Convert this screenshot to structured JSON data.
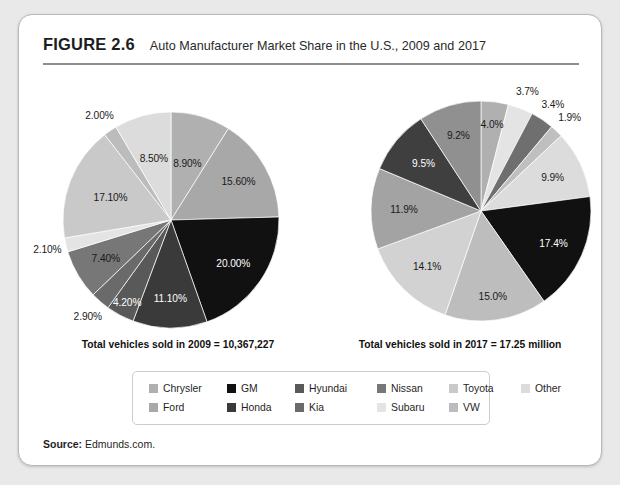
{
  "figure": {
    "number": "FIGURE 2.6",
    "title": "Auto Manufacturer Market Share in the U.S., 2009 and 2017"
  },
  "source": {
    "label": "Source:",
    "text": "Edmunds.com."
  },
  "legend": {
    "rows": [
      [
        {
          "label": "Chrysler",
          "color": "#b0b0b0"
        },
        {
          "label": "GM",
          "color": "#111111"
        },
        {
          "label": "Hyundai",
          "color": "#595959"
        },
        {
          "label": "Nissan",
          "color": "#777777"
        },
        {
          "label": "Toyota",
          "color": "#c9c9c9"
        },
        {
          "label": "Other",
          "color": "#dcdcdc"
        }
      ],
      [
        {
          "label": "Ford",
          "color": "#a8a8a8"
        },
        {
          "label": "Honda",
          "color": "#3a3a3a"
        },
        {
          "label": "Kia",
          "color": "#6a6a6a"
        },
        {
          "label": "Subaru",
          "color": "#e4e4e4"
        },
        {
          "label": "VW",
          "color": "#bcbcbc"
        }
      ]
    ]
  },
  "chart_data": [
    {
      "type": "pie",
      "title": "Auto Manufacturer Market Share in the U.S., 2009",
      "caption": "Total vehicles sold in 2009 = 10,367,227",
      "legend_position": "bottom",
      "labels": [
        "Chrysler",
        "GM",
        "Hyundai",
        "Nissan",
        "Toyota",
        "Other",
        "Ford",
        "Honda",
        "Kia",
        "Subaru",
        "VW"
      ],
      "slices": [
        {
          "name": "Chrysler",
          "value": 8.9,
          "display": "8.90%",
          "color": "#b0b0b0"
        },
        {
          "name": "Ford",
          "value": 15.6,
          "display": "15.60%",
          "color": "#a8a8a8"
        },
        {
          "name": "GM",
          "value": 20.0,
          "display": "20.00%",
          "color": "#111111"
        },
        {
          "name": "Honda",
          "value": 11.1,
          "display": "11.10%",
          "color": "#3a3a3a"
        },
        {
          "name": "Hyundai",
          "value": 4.2,
          "display": "4.20%",
          "color": "#595959"
        },
        {
          "name": "Kia",
          "value": 2.9,
          "display": "2.90%",
          "color": "#6a6a6a"
        },
        {
          "name": "Nissan",
          "value": 7.4,
          "display": "7.40%",
          "color": "#777777"
        },
        {
          "name": "Subaru",
          "value": 2.1,
          "display": "2.10%",
          "color": "#e4e4e4"
        },
        {
          "name": "Toyota",
          "value": 17.1,
          "display": "17.10%",
          "color": "#c9c9c9"
        },
        {
          "name": "VW",
          "value": 2.0,
          "display": "2.00%",
          "color": "#bcbcbc"
        },
        {
          "name": "Other",
          "value": 8.5,
          "display": "8.50%",
          "color": "#dcdcdc"
        }
      ]
    },
    {
      "type": "pie",
      "title": "Auto Manufacturer Market Share in the U.S., 2017",
      "caption": "Total vehicles sold in 2017 = 17.25 million",
      "legend_position": "bottom",
      "labels": [
        "Chrysler",
        "GM",
        "Hyundai",
        "Nissan",
        "Toyota",
        "Other",
        "Ford",
        "Honda",
        "Kia",
        "Subaru",
        "VW"
      ],
      "slices": [
        {
          "name": "Chrysler",
          "value": 4.0,
          "display": "4.0%",
          "color": "#b0b0b0"
        },
        {
          "name": "Subaru",
          "value": 3.7,
          "display": "3.7%",
          "color": "#e4e4e4"
        },
        {
          "name": "VW",
          "value": 3.4,
          "display": "3.4%",
          "color": "#6f6f6f"
        },
        {
          "name": "Other",
          "value": 1.9,
          "display": "1.9%",
          "color": "#bfbfbf"
        },
        {
          "name": "Toyota",
          "value": 9.9,
          "display": "9.9%",
          "color": "#dcdcdc"
        },
        {
          "name": "GM",
          "value": 17.4,
          "display": "17.4%",
          "color": "#111111"
        },
        {
          "name": "Ford",
          "value": 15.0,
          "display": "15.0%",
          "color": "#bdbdbd"
        },
        {
          "name": "Nissan",
          "value": 14.1,
          "display": "14.1%",
          "color": "#d2d2d2"
        },
        {
          "name": "Honda",
          "value": 11.9,
          "display": "11.9%",
          "color": "#a3a3a3"
        },
        {
          "name": "Hyundai",
          "value": 9.5,
          "display": "9.5%",
          "color": "#3f3f3f"
        },
        {
          "name": "Kia",
          "value": 9.2,
          "display": "9.2%",
          "color": "#909090"
        }
      ]
    }
  ]
}
